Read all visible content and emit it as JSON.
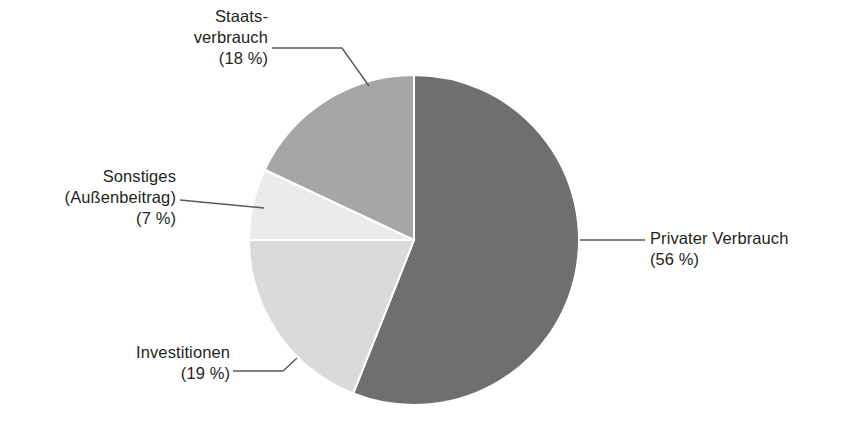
{
  "chart_data": {
    "type": "pie",
    "title": "",
    "subtitle": "",
    "xlabel": "",
    "ylabel": "",
    "legend_position": "callout-labels",
    "grid": false,
    "units": "%",
    "start_angle_deg": 0,
    "direction": "clockwise",
    "categories": [
      "Privater Verbrauch",
      "Investitionen",
      "Sonstiges (Außenbeitrag)",
      "Staatsverbrauch"
    ],
    "values": [
      56,
      19,
      7,
      18
    ],
    "colors": [
      "#6f6f6f",
      "#dadada",
      "#ebebeb",
      "#a6a6a6"
    ],
    "slices": [
      {
        "name": "Privater Verbrauch",
        "label_line1": "Privater Verbrauch",
        "label_line2": "(56 %)",
        "value": 56,
        "color": "#6f6f6f",
        "start_deg": 0,
        "end_deg": 201.6
      },
      {
        "name": "Investitionen",
        "label_line1": "Investitionen",
        "label_line2": "(19 %)",
        "value": 19,
        "color": "#dadada",
        "start_deg": 201.6,
        "end_deg": 270
      },
      {
        "name": "Sonstiges (Außenbeitrag)",
        "label_line1": "Sonstiges",
        "label_line2": "(Außenbeitrag)",
        "label_line3": "(7 %)",
        "value": 7,
        "color": "#ebebeb",
        "start_deg": 270,
        "end_deg": 295.2
      },
      {
        "name": "Staatsverbrauch",
        "label_line1": "Staats-",
        "label_line2": "verbrauch",
        "label_line3": "(18 %)",
        "value": 18,
        "color": "#a6a6a6",
        "start_deg": 295.2,
        "end_deg": 360
      }
    ]
  },
  "labels": {
    "staatsverbrauch": {
      "line1": "Staats-",
      "line2": "verbrauch",
      "line3": "(18 %)"
    },
    "sonstiges": {
      "line1": "Sonstiges",
      "line2": "(Außenbeitrag)",
      "line3": "(7 %)"
    },
    "investitionen": {
      "line1": "Investitionen",
      "line2": "(19 %)"
    },
    "privater": {
      "line1": "Privater Verbrauch",
      "line2": "(56 %)"
    }
  },
  "style": {
    "background": "#ffffff",
    "text_color": "#231f20",
    "leader_line_color": "#5a5a5a",
    "slice_divider_color": "#ffffff"
  }
}
